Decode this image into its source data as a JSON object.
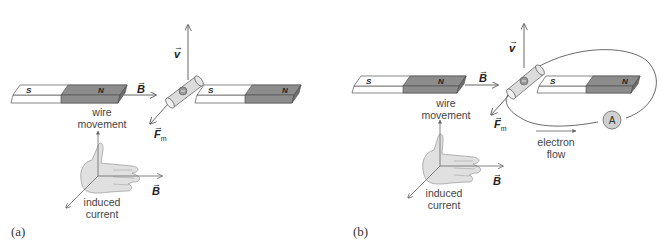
{
  "colors": {
    "arrow": "#666666",
    "magnet_light": "#ffffff",
    "magnet_dark": "#8c8c8c",
    "magnet_edge": "#555555",
    "wire_fill": "#dcdcdc",
    "ammeter_fill": "#d0d0d0",
    "hand_fill": "#e0e0e0"
  },
  "panels": [
    {
      "id": "a",
      "label": "(a)",
      "magnet_left": {
        "south": "S",
        "north": "N"
      },
      "magnet_right": {
        "south": "S",
        "north": "N"
      },
      "vectors": {
        "velocity": "v",
        "field": "B",
        "force": "F",
        "force_sub": "m"
      },
      "hand": {
        "wire_movement": [
          "wire",
          "movement"
        ],
        "field": "B",
        "induced_current": [
          "induced",
          "current"
        ]
      }
    },
    {
      "id": "b",
      "label": "(b)",
      "magnet_left": {
        "south": "S",
        "north": "N"
      },
      "magnet_right": {
        "south": "S",
        "north": "N"
      },
      "vectors": {
        "velocity": "v",
        "field": "B",
        "force": "F",
        "force_sub": "m"
      },
      "ammeter": "A",
      "electron_flow": [
        "electron",
        "flow"
      ],
      "hand": {
        "wire_movement": [
          "wire",
          "movement"
        ],
        "field": "B",
        "induced_current": [
          "induced",
          "current"
        ]
      }
    }
  ]
}
